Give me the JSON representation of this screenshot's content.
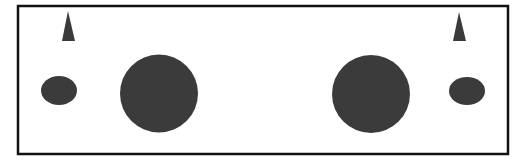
{
  "colors": {
    "background": "#ffffff",
    "border": "#111111",
    "shape_fill": "#3b3b3b"
  },
  "frame": {
    "x": 18,
    "y": 6,
    "width": 490,
    "height": 148,
    "stroke_width": 2.5
  },
  "shapes": {
    "triangles": [
      {
        "name": "left-triangle",
        "points": "68,11 62,41 75,41"
      },
      {
        "name": "right-triangle",
        "points": "459,12 453,41 466,41"
      }
    ],
    "small_ellipses": [
      {
        "name": "left-small-ellipse",
        "cx": 59,
        "cy": 90.5,
        "rx": 18,
        "ry": 14.5
      },
      {
        "name": "right-small-ellipse",
        "cx": 467,
        "cy": 91,
        "rx": 18,
        "ry": 14
      }
    ],
    "large_circles": [
      {
        "name": "left-large-circle",
        "cx": 159,
        "cy": 93.5,
        "r": 39
      },
      {
        "name": "right-large-circle",
        "cx": 371,
        "cy": 94,
        "r": 39
      }
    ]
  }
}
